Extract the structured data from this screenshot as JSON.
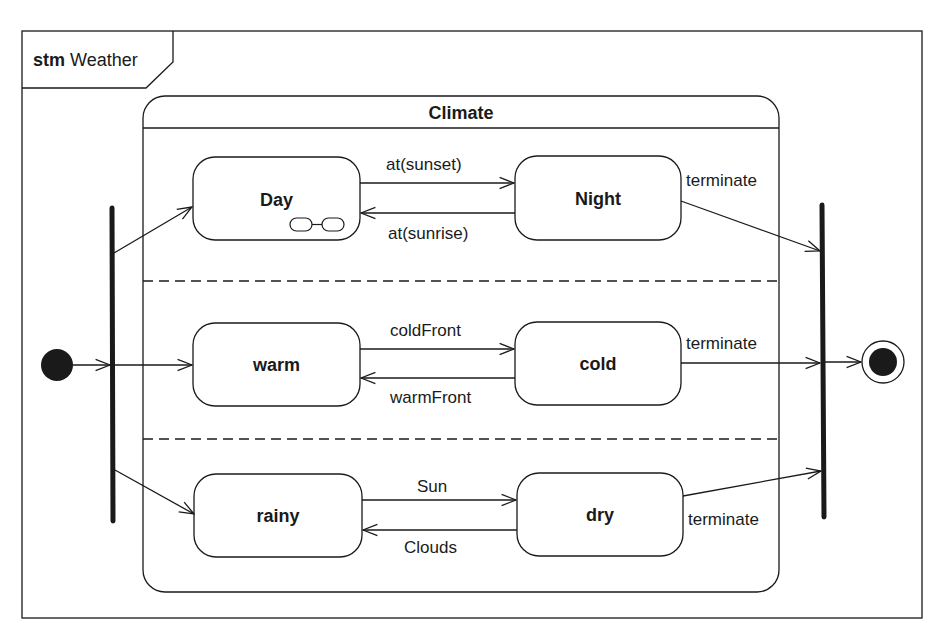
{
  "frame": {
    "kind": "stm",
    "name": "Weather"
  },
  "composite_state": {
    "name": "Climate"
  },
  "regions": [
    {
      "states": [
        {
          "name": "Day",
          "has_submachine_icon": true
        },
        {
          "name": "Night"
        }
      ],
      "transitions": [
        {
          "from": "Day",
          "to": "Night",
          "label": "at(sunset)"
        },
        {
          "from": "Night",
          "to": "Day",
          "label": "at(sunrise)"
        },
        {
          "from": "Night",
          "to": "join",
          "label": "terminate"
        }
      ]
    },
    {
      "states": [
        {
          "name": "warm"
        },
        {
          "name": "cold"
        }
      ],
      "transitions": [
        {
          "from": "warm",
          "to": "cold",
          "label": "coldFront"
        },
        {
          "from": "cold",
          "to": "warm",
          "label": "warmFront"
        },
        {
          "from": "cold",
          "to": "join",
          "label": "terminate"
        }
      ]
    },
    {
      "states": [
        {
          "name": "rainy"
        },
        {
          "name": "dry"
        }
      ],
      "transitions": [
        {
          "from": "rainy",
          "to": "dry",
          "label": "Sun"
        },
        {
          "from": "dry",
          "to": "rainy",
          "label": "Clouds"
        },
        {
          "from": "dry",
          "to": "join",
          "label": "terminate"
        }
      ]
    }
  ],
  "pseudostates": {
    "initial": "initial-node",
    "fork": "fork-bar",
    "join": "join-bar",
    "final": "final-node"
  },
  "colors": {
    "line": "#1a1a1a",
    "background": "#ffffff"
  }
}
